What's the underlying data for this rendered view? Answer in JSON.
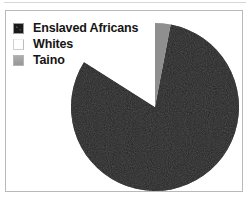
{
  "figure": {
    "background_color": "#ffffff",
    "frame_color": "#b9b9b9"
  },
  "legend": {
    "items": [
      {
        "label": "Enslaved Africans",
        "swatch": "black-swatch-icon",
        "color": "#1a1a1a"
      },
      {
        "label": "Whites",
        "swatch": "white-swatch-icon",
        "color": "#ffffff"
      },
      {
        "label": "Taino",
        "swatch": "gray-swatch-icon",
        "color": "#9d9d9d"
      }
    ]
  },
  "chart_data": {
    "type": "pie",
    "title": "",
    "labels": [
      "Enslaved Africans",
      "Whites",
      "Taino"
    ],
    "values": [
      81,
      16,
      3
    ],
    "colors": [
      "#1a1a1a",
      "#ffffff",
      "#9d9d9d"
    ],
    "legend_position": "top-left",
    "start_angle_deg": 90,
    "direction": "clockwise",
    "grid": false,
    "center": {
      "x": 155,
      "y": 107
    },
    "radius": 84,
    "slice_order_from_top_clockwise": [
      "Enslaved Africans",
      "Whites",
      "Taino"
    ]
  }
}
